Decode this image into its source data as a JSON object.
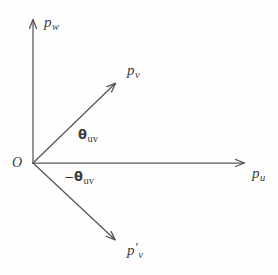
{
  "figure": {
    "kind": "vector-angle-diagram",
    "background_color": "#fefefe",
    "stroke_color": "#555555",
    "text_color": "#3b3b3b",
    "width": 278,
    "height": 275
  },
  "origin": {
    "label": "O",
    "x": 33,
    "y": 163
  },
  "axes": [
    {
      "name": "vertical-axis",
      "base": "p",
      "subscript": "w",
      "label": "p_w",
      "from": {
        "x": 33,
        "y": 163
      },
      "to": {
        "x": 33,
        "y": 16
      }
    },
    {
      "name": "horizontal-axis",
      "base": "p",
      "subscript": "u",
      "label": "p_u",
      "from": {
        "x": 33,
        "y": 163
      },
      "to": {
        "x": 248,
        "y": 163
      }
    }
  ],
  "vectors": [
    {
      "name": "vector-pv",
      "base": "p",
      "subscript": "v",
      "prime": "",
      "label": "p_v",
      "from": {
        "x": 33,
        "y": 163
      },
      "to": {
        "x": 118,
        "y": 80
      },
      "angle_degrees": 44
    },
    {
      "name": "vector-pv-prime",
      "base": "p",
      "subscript": "v",
      "prime": "′",
      "label": "p'_v",
      "from": {
        "x": 33,
        "y": 163
      },
      "to": {
        "x": 118,
        "y": 243
      },
      "angle_degrees": -43
    }
  ],
  "angles": [
    {
      "name": "angle-theta-uv",
      "sign": "",
      "symbol": "θ",
      "subscript": "uv",
      "label": "θ_uv",
      "between": [
        "horizontal-axis",
        "vector-pv"
      ]
    },
    {
      "name": "angle-negative-theta-uv",
      "sign": "−",
      "symbol": "θ",
      "subscript": "uv",
      "label": "-θ_uv",
      "between": [
        "horizontal-axis",
        "vector-pv-prime"
      ]
    }
  ]
}
